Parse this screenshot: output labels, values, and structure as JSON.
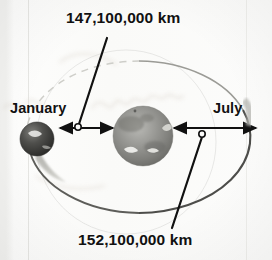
{
  "figure": {
    "title_alt": "Earth orbit around the Sun showing perihelion and aphelion distances",
    "labels": {
      "perihelion_distance": "147,100,000 km",
      "aphelion_distance": "152,100,000 km",
      "month_left": "January",
      "month_right": "July"
    },
    "bodies": [
      {
        "name": "sun",
        "role": "Sun",
        "cx": 143,
        "cy": 136,
        "r": 30
      },
      {
        "name": "earth-january",
        "role": "Earth in January",
        "cx": 37,
        "cy": 139,
        "r": 17
      }
    ],
    "markers": [
      {
        "name": "leader-dot-top",
        "cx": 78,
        "cy": 127,
        "r": 3
      },
      {
        "name": "leader-dot-bottom",
        "cx": 202,
        "cy": 134,
        "r": 3
      }
    ],
    "arrows": [
      {
        "name": "perihelion-arrow",
        "from_x": 60,
        "to_x": 113,
        "y": 128,
        "double_headed": true
      },
      {
        "name": "aphelion-arrow",
        "from_x": 174,
        "to_x": 256,
        "y": 128,
        "double_headed": true
      }
    ],
    "orbit": {
      "name": "orbit-ellipse",
      "cx": 139,
      "cy": 137,
      "rx": 113,
      "ry": 76
    },
    "colors": {
      "paper": "#fbfbfa",
      "ink": "#111111",
      "orbit_line": "#6d6d6d",
      "orbit_faint": "#c9c9c6",
      "sun_body": "#8d8d8a",
      "earth_body": "#4a4a48",
      "handwriting": "#d7cfc6"
    },
    "annotations": {
      "handwriting_faint": "faint pencil handwriting bleed-through"
    }
  }
}
